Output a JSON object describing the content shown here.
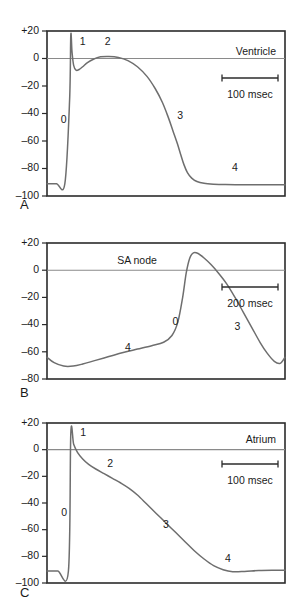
{
  "figure": {
    "background_color": "#ffffff",
    "trace_color": "#6e6e6e",
    "axis_color": "#2b2b2b",
    "zeroline_color": "#8a8a8a"
  },
  "panels": [
    {
      "letter": "A",
      "tissue_label": "Ventricle",
      "scale_label": "100 msec",
      "ylabel": "",
      "yticks": [
        "+20",
        "0",
        "–20",
        "–40",
        "–60",
        "–80",
        "–100"
      ],
      "ytick_values": [
        20,
        0,
        -20,
        -40,
        -60,
        -80,
        -100
      ],
      "phase_labels": [
        "0",
        "1",
        "2",
        "3",
        "4"
      ]
    },
    {
      "letter": "B",
      "tissue_label": "SA node",
      "scale_label": "200 msec",
      "ylabel": "",
      "yticks": [
        "+20",
        "0",
        "–20",
        "–40",
        "–60",
        "–80"
      ],
      "ytick_values": [
        20,
        0,
        -20,
        -40,
        -60,
        -80
      ],
      "phase_labels": [
        "4",
        "0",
        "3"
      ]
    },
    {
      "letter": "C",
      "tissue_label": "Atrium",
      "scale_label": "100 msec",
      "ylabel": "",
      "yticks": [
        "+20",
        "0",
        "–20",
        "–40",
        "–60",
        "–80",
        "–100"
      ],
      "ytick_values": [
        20,
        0,
        -20,
        -40,
        -60,
        -80,
        -100
      ],
      "phase_labels": [
        "0",
        "1",
        "2",
        "3",
        "4"
      ]
    }
  ],
  "chart_data": [
    {
      "type": "line",
      "title": "Ventricle",
      "panel": "A",
      "xlabel": "",
      "ylabel": "Membrane potential (mV)",
      "ylim": [
        -100,
        20
      ],
      "xlim": [
        0,
        1000
      ],
      "grid": false,
      "legend": false,
      "scale_bar": {
        "label": "100 msec",
        "value": 100,
        "units": "msec"
      },
      "annotations": [
        {
          "text": "0",
          "x": 70,
          "y": -45
        },
        {
          "text": "1",
          "x": 150,
          "y": 12
        },
        {
          "text": "2",
          "x": 255,
          "y": 12
        },
        {
          "text": "3",
          "x": 560,
          "y": -42
        },
        {
          "text": "4",
          "x": 790,
          "y": -80
        }
      ],
      "series": [
        {
          "name": "Ventricular action potential",
          "x": [
            0,
            40,
            75,
            95,
            100,
            105,
            112,
            122,
            135,
            150,
            170,
            195,
            225,
            260,
            300,
            340,
            380,
            420,
            455,
            485,
            510,
            530,
            548,
            562,
            575,
            590,
            608,
            630,
            660,
            700,
            750,
            810,
            880,
            950,
            1000
          ],
          "y": [
            -91,
            -91,
            -91,
            -30,
            17,
            5,
            -5,
            -8.5,
            -8,
            -6,
            -3,
            -0.5,
            1.2,
            1.5,
            0.8,
            -1.5,
            -6,
            -13,
            -22,
            -32,
            -43,
            -53,
            -62,
            -70,
            -77,
            -83,
            -87,
            -89.5,
            -90.8,
            -91.4,
            -91.7,
            -91.8,
            -91.9,
            -91.9,
            -91.9
          ]
        }
      ]
    },
    {
      "type": "line",
      "title": "SA node",
      "panel": "B",
      "xlabel": "",
      "ylabel": "Membrane potential (mV)",
      "ylim": [
        -80,
        20
      ],
      "xlim": [
        0,
        1000
      ],
      "grid": false,
      "legend": false,
      "scale_bar": {
        "label": "200 msec",
        "value": 200,
        "units": "msec"
      },
      "annotations": [
        {
          "text": "4",
          "x": 340,
          "y": -57
        },
        {
          "text": "0",
          "x": 540,
          "y": -38
        },
        {
          "text": "3",
          "x": 800,
          "y": -42
        }
      ],
      "series": [
        {
          "name": "SA node pacemaker potential",
          "x": [
            0,
            30,
            70,
            110,
            150,
            200,
            260,
            320,
            380,
            440,
            490,
            525,
            550,
            570,
            585,
            600,
            615,
            635,
            660,
            690,
            720,
            755,
            790,
            825,
            860,
            895,
            925,
            955,
            980,
            1000
          ],
          "y": [
            -64,
            -68,
            -70.5,
            -70.5,
            -69,
            -66.5,
            -63.5,
            -60.5,
            -58,
            -55.5,
            -53,
            -48,
            -38,
            -20,
            -2,
            9,
            12.8,
            12.3,
            9,
            4,
            -2,
            -10,
            -20,
            -31,
            -42,
            -53,
            -61,
            -67,
            -68.5,
            -64
          ]
        }
      ]
    },
    {
      "type": "line",
      "title": "Atrium",
      "panel": "C",
      "xlabel": "",
      "ylabel": "Membrane potential (mV)",
      "ylim": [
        -100,
        20
      ],
      "xlim": [
        0,
        1000
      ],
      "grid": false,
      "legend": false,
      "scale_bar": {
        "label": "100 msec",
        "value": 100,
        "units": "msec"
      },
      "annotations": [
        {
          "text": "0",
          "x": 72,
          "y": -48
        },
        {
          "text": "1",
          "x": 152,
          "y": 12
        },
        {
          "text": "2",
          "x": 265,
          "y": -11
        },
        {
          "text": "3",
          "x": 500,
          "y": -57
        },
        {
          "text": "4",
          "x": 760,
          "y": -82
        }
      ],
      "series": [
        {
          "name": "Atrial action potential",
          "x": [
            0,
            45,
            90,
            100,
            112,
            128,
            150,
            175,
            205,
            240,
            275,
            310,
            345,
            380,
            420,
            460,
            500,
            540,
            580,
            620,
            660,
            700,
            740,
            780,
            830,
            890,
            950,
            1000
          ],
          "y": [
            -91,
            -91,
            -91,
            12,
            4,
            -2,
            -7,
            -11,
            -14.5,
            -18,
            -21.5,
            -25,
            -29,
            -34,
            -41,
            -48,
            -55,
            -62,
            -69,
            -76,
            -82,
            -87,
            -90,
            -91.5,
            -91.3,
            -90.6,
            -90.4,
            -90.4
          ]
        }
      ]
    }
  ]
}
